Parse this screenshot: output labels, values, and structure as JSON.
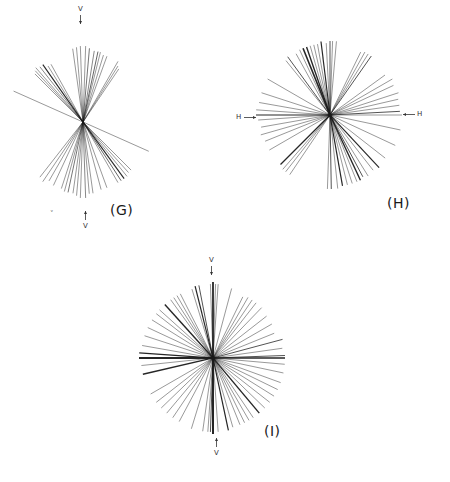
{
  "figure": {
    "line_color": "#1a1a1a",
    "panels": [
      {
        "id": "G",
        "label": "(G)",
        "label_pos": [
          110,
          202
        ],
        "center": [
          83,
          122
        ],
        "axis": "V",
        "axis_labels": [
          {
            "text": "V",
            "pos": [
              78,
              5
            ],
            "arrow": "down"
          },
          {
            "text": "V",
            "pos": [
              83,
              222
            ],
            "arrow": "up"
          }
        ],
        "description": "Line segments clustered around the vertical axis (V), bow-tie distribution",
        "segments": [
          {
            "deg": 88,
            "r": 76,
            "w": 0.6
          },
          {
            "deg": 92,
            "r": 76,
            "w": 0.6
          },
          {
            "deg": 85,
            "r": 74,
            "w": 0.8
          },
          {
            "deg": 95,
            "r": 75,
            "w": 0.6
          },
          {
            "deg": 98,
            "r": 74,
            "w": 0.6
          },
          {
            "deg": 81,
            "r": 72,
            "w": 0.7
          },
          {
            "deg": 78,
            "r": 72,
            "w": 0.9
          },
          {
            "deg": 76,
            "r": 72,
            "w": 0.6
          },
          {
            "deg": 73,
            "r": 70,
            "w": 0.6
          },
          {
            "deg": 70,
            "r": 70,
            "w": 0.6
          },
          {
            "deg": 60,
            "r": 70,
            "w": 0.6
          },
          {
            "deg": 58,
            "r": 66,
            "w": 0.6
          },
          {
            "deg": 56,
            "r": 64,
            "w": 0.6
          },
          {
            "deg": 125,
            "r": 70,
            "w": 1.1
          },
          {
            "deg": 128,
            "r": 70,
            "w": 0.7
          },
          {
            "deg": 131,
            "r": 72,
            "w": 0.6
          },
          {
            "deg": 133,
            "r": 70,
            "w": 0.6
          },
          {
            "deg": 122,
            "r": 66,
            "w": 0.6
          },
          {
            "deg": 119,
            "r": 66,
            "w": 0.6
          },
          {
            "deg": 135,
            "r": 68,
            "w": 0.6
          },
          {
            "deg": 156,
            "r": 76,
            "w": 0.6
          },
          {
            "deg": 268,
            "r": 76,
            "w": 0.6
          },
          {
            "deg": 272,
            "r": 76,
            "w": 0.7
          },
          {
            "deg": 265,
            "r": 74,
            "w": 0.6
          },
          {
            "deg": 275,
            "r": 72,
            "w": 0.6
          },
          {
            "deg": 278,
            "r": 72,
            "w": 0.6
          },
          {
            "deg": 262,
            "r": 72,
            "w": 0.6
          },
          {
            "deg": 258,
            "r": 72,
            "w": 0.8
          },
          {
            "deg": 255,
            "r": 72,
            "w": 0.6
          },
          {
            "deg": 252,
            "r": 70,
            "w": 0.6
          },
          {
            "deg": 245,
            "r": 70,
            "w": 0.6
          },
          {
            "deg": 240,
            "r": 68,
            "w": 0.6
          },
          {
            "deg": 236,
            "r": 72,
            "w": 0.6
          },
          {
            "deg": 232,
            "r": 70,
            "w": 0.6
          },
          {
            "deg": 300,
            "r": 70,
            "w": 0.6
          },
          {
            "deg": 303,
            "r": 70,
            "w": 0.9
          },
          {
            "deg": 306,
            "r": 70,
            "w": 1.1
          },
          {
            "deg": 309,
            "r": 70,
            "w": 0.6
          },
          {
            "deg": 312,
            "r": 68,
            "w": 0.6
          },
          {
            "deg": 315,
            "r": 68,
            "w": 0.6
          },
          {
            "deg": 290,
            "r": 70,
            "w": 0.6
          },
          {
            "deg": 285,
            "r": 70,
            "w": 0.6
          },
          {
            "deg": 336,
            "r": 72,
            "w": 0.6
          }
        ]
      },
      {
        "id": "H",
        "label": "(H)",
        "label_pos": [
          387,
          195
        ],
        "center": [
          330,
          115
        ],
        "axis": "H",
        "axis_labels": [
          {
            "text": "H",
            "pos": [
              236,
              113
            ],
            "arrow": "right"
          },
          {
            "text": "H",
            "pos": [
              417,
              110
            ],
            "arrow": "left"
          }
        ],
        "description": "Line segments broadly distributed, mild concentration near horizontal axis (H)",
        "segments": [
          {
            "deg": 0,
            "r": 72,
            "w": 0.6
          },
          {
            "deg": 3,
            "r": 70,
            "w": 1.0
          },
          {
            "deg": 8,
            "r": 70,
            "w": 0.6
          },
          {
            "deg": 13,
            "r": 70,
            "w": 0.6
          },
          {
            "deg": 18,
            "r": 72,
            "w": 0.6
          },
          {
            "deg": 25,
            "r": 70,
            "w": 0.6
          },
          {
            "deg": 30,
            "r": 72,
            "w": 0.6
          },
          {
            "deg": 36,
            "r": 68,
            "w": 0.6
          },
          {
            "deg": 55,
            "r": 72,
            "w": 1.0
          },
          {
            "deg": 58,
            "r": 72,
            "w": 0.6
          },
          {
            "deg": 61,
            "r": 72,
            "w": 0.6
          },
          {
            "deg": 64,
            "r": 70,
            "w": 0.6
          },
          {
            "deg": 85,
            "r": 74,
            "w": 0.6
          },
          {
            "deg": 88,
            "r": 74,
            "w": 0.6
          },
          {
            "deg": 90,
            "r": 74,
            "w": 1.0
          },
          {
            "deg": 93,
            "r": 72,
            "w": 0.6
          },
          {
            "deg": 97,
            "r": 74,
            "w": 1.2
          },
          {
            "deg": 100,
            "r": 72,
            "w": 0.6
          },
          {
            "deg": 103,
            "r": 72,
            "w": 0.6
          },
          {
            "deg": 106,
            "r": 72,
            "w": 0.6
          },
          {
            "deg": 109,
            "r": 72,
            "w": 1.4
          },
          {
            "deg": 112,
            "r": 72,
            "w": 1.6
          },
          {
            "deg": 115,
            "r": 72,
            "w": 0.6
          },
          {
            "deg": 119,
            "r": 70,
            "w": 0.6
          },
          {
            "deg": 126,
            "r": 72,
            "w": 1.0
          },
          {
            "deg": 129,
            "r": 70,
            "w": 0.6
          },
          {
            "deg": 150,
            "r": 72,
            "w": 0.6
          },
          {
            "deg": 162,
            "r": 72,
            "w": 0.6
          },
          {
            "deg": 170,
            "r": 72,
            "w": 0.6
          },
          {
            "deg": 176,
            "r": 74,
            "w": 0.6
          },
          {
            "deg": 180,
            "r": 74,
            "w": 1.2
          },
          {
            "deg": 184,
            "r": 72,
            "w": 0.6
          },
          {
            "deg": 190,
            "r": 70,
            "w": 0.6
          },
          {
            "deg": 196,
            "r": 72,
            "w": 0.6
          },
          {
            "deg": 202,
            "r": 70,
            "w": 0.6
          },
          {
            "deg": 210,
            "r": 70,
            "w": 0.6
          },
          {
            "deg": 225,
            "r": 70,
            "w": 1.2
          },
          {
            "deg": 229,
            "r": 72,
            "w": 0.6
          },
          {
            "deg": 232,
            "r": 72,
            "w": 0.6
          },
          {
            "deg": 236,
            "r": 72,
            "w": 0.6
          },
          {
            "deg": 268,
            "r": 74,
            "w": 0.6
          },
          {
            "deg": 271,
            "r": 74,
            "w": 1.0
          },
          {
            "deg": 276,
            "r": 74,
            "w": 0.6
          },
          {
            "deg": 280,
            "r": 72,
            "w": 1.2
          },
          {
            "deg": 284,
            "r": 72,
            "w": 0.6
          },
          {
            "deg": 288,
            "r": 72,
            "w": 0.6
          },
          {
            "deg": 292,
            "r": 72,
            "w": 0.6
          },
          {
            "deg": 295,
            "r": 72,
            "w": 1.4
          },
          {
            "deg": 298,
            "r": 70,
            "w": 1.0
          },
          {
            "deg": 302,
            "r": 72,
            "w": 0.6
          },
          {
            "deg": 308,
            "r": 70,
            "w": 0.6
          },
          {
            "deg": 313,
            "r": 72,
            "w": 1.2
          },
          {
            "deg": 322,
            "r": 70,
            "w": 0.6
          },
          {
            "deg": 335,
            "r": 72,
            "w": 0.6
          },
          {
            "deg": 348,
            "r": 72,
            "w": 0.6
          }
        ]
      },
      {
        "id": "I",
        "label": "(I)",
        "label_pos": [
          264,
          423
        ],
        "center": [
          213,
          358
        ],
        "axis": "V",
        "axis_labels": [
          {
            "text": "V",
            "pos": [
              209,
              256
            ],
            "arrow": "down"
          },
          {
            "text": "V",
            "pos": [
              214,
              449
            ],
            "arrow": "up"
          }
        ],
        "description": "Dense, nearly uniform radial distribution of line segments",
        "segments": [
          {
            "deg": 0,
            "r": 72,
            "w": 1.6
          },
          {
            "deg": 2,
            "r": 72,
            "w": 1.0
          },
          {
            "deg": 8,
            "r": 70,
            "w": 0.6
          },
          {
            "deg": 15,
            "r": 72,
            "w": 1.0
          },
          {
            "deg": 22,
            "r": 66,
            "w": 0.6
          },
          {
            "deg": 30,
            "r": 68,
            "w": 0.6
          },
          {
            "deg": 38,
            "r": 68,
            "w": 0.6
          },
          {
            "deg": 46,
            "r": 70,
            "w": 0.6
          },
          {
            "deg": 52,
            "r": 70,
            "w": 0.6
          },
          {
            "deg": 56,
            "r": 70,
            "w": 0.6
          },
          {
            "deg": 60,
            "r": 70,
            "w": 0.6
          },
          {
            "deg": 64,
            "r": 68,
            "w": 0.6
          },
          {
            "deg": 75,
            "r": 72,
            "w": 0.6
          },
          {
            "deg": 86,
            "r": 74,
            "w": 0.6
          },
          {
            "deg": 88,
            "r": 74,
            "w": 0.6
          },
          {
            "deg": 90,
            "r": 76,
            "w": 1.8
          },
          {
            "deg": 92,
            "r": 74,
            "w": 0.6
          },
          {
            "deg": 101,
            "r": 74,
            "w": 1.0
          },
          {
            "deg": 104,
            "r": 74,
            "w": 1.2
          },
          {
            "deg": 107,
            "r": 72,
            "w": 0.6
          },
          {
            "deg": 117,
            "r": 72,
            "w": 0.6
          },
          {
            "deg": 120,
            "r": 72,
            "w": 0.6
          },
          {
            "deg": 123,
            "r": 72,
            "w": 0.6
          },
          {
            "deg": 126,
            "r": 72,
            "w": 0.6
          },
          {
            "deg": 132,
            "r": 72,
            "w": 1.4
          },
          {
            "deg": 138,
            "r": 72,
            "w": 0.6
          },
          {
            "deg": 142,
            "r": 72,
            "w": 0.6
          },
          {
            "deg": 148,
            "r": 72,
            "w": 0.6
          },
          {
            "deg": 155,
            "r": 72,
            "w": 0.6
          },
          {
            "deg": 162,
            "r": 72,
            "w": 0.6
          },
          {
            "deg": 170,
            "r": 72,
            "w": 0.6
          },
          {
            "deg": 176,
            "r": 74,
            "w": 1.4
          },
          {
            "deg": 180,
            "r": 74,
            "w": 2.0
          },
          {
            "deg": 186,
            "r": 72,
            "w": 0.6
          },
          {
            "deg": 193,
            "r": 72,
            "w": 1.4
          },
          {
            "deg": 210,
            "r": 72,
            "w": 0.6
          },
          {
            "deg": 218,
            "r": 72,
            "w": 0.6
          },
          {
            "deg": 224,
            "r": 72,
            "w": 0.6
          },
          {
            "deg": 230,
            "r": 72,
            "w": 0.6
          },
          {
            "deg": 236,
            "r": 72,
            "w": 0.6
          },
          {
            "deg": 242,
            "r": 72,
            "w": 0.6
          },
          {
            "deg": 253,
            "r": 74,
            "w": 0.6
          },
          {
            "deg": 262,
            "r": 74,
            "w": 0.6
          },
          {
            "deg": 266,
            "r": 74,
            "w": 0.6
          },
          {
            "deg": 268,
            "r": 74,
            "w": 1.0
          },
          {
            "deg": 270,
            "r": 76,
            "w": 2.0
          },
          {
            "deg": 274,
            "r": 74,
            "w": 0.6
          },
          {
            "deg": 282,
            "r": 74,
            "w": 1.2
          },
          {
            "deg": 286,
            "r": 72,
            "w": 0.6
          },
          {
            "deg": 292,
            "r": 72,
            "w": 0.6
          },
          {
            "deg": 296,
            "r": 72,
            "w": 0.6
          },
          {
            "deg": 300,
            "r": 72,
            "w": 0.6
          },
          {
            "deg": 304,
            "r": 72,
            "w": 0.6
          },
          {
            "deg": 310,
            "r": 72,
            "w": 1.4
          },
          {
            "deg": 316,
            "r": 72,
            "w": 0.6
          },
          {
            "deg": 322,
            "r": 72,
            "w": 0.6
          },
          {
            "deg": 328,
            "r": 72,
            "w": 0.6
          },
          {
            "deg": 334,
            "r": 72,
            "w": 0.6
          },
          {
            "deg": 340,
            "r": 72,
            "w": 0.6
          },
          {
            "deg": 348,
            "r": 72,
            "w": 0.6
          },
          {
            "deg": 355,
            "r": 72,
            "w": 0.6
          }
        ]
      }
    ],
    "stray_mark": {
      "text": "ˬ",
      "pos": [
        50,
        204
      ]
    }
  }
}
